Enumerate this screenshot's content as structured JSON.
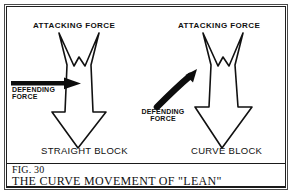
{
  "figure": {
    "number_label": "FIG. 30",
    "caption": "THE CURVE MOVEMENT OF \"LEAN\"",
    "panels": [
      {
        "id": "straight-block",
        "title": "STRAIGHT BLOCK",
        "attacking_force_label": "ATTACKING FORCE",
        "defending_force_label": "DEFENDING\nFORCE",
        "defending_force_line1": "DEFENDING",
        "defending_force_line2": "FORCE",
        "defending_arrow_type": "straight-right-arrow",
        "attacking_arrow_type": "double-headed-down-arrow"
      },
      {
        "id": "curve-block",
        "title": "CURVE BLOCK",
        "attacking_force_label": "ATTACKING FORCE",
        "defending_force_label": "DEFENDING\nFORCE",
        "defending_force_line1": "DEFENDING",
        "defending_force_line2": "FORCE",
        "defending_arrow_type": "curved-up-right-arrow",
        "attacking_arrow_type": "double-headed-down-arrow"
      }
    ]
  },
  "colors": {
    "ink": "#111111",
    "frame_outer": "#4a4a4a",
    "frame_inner": "#202020",
    "paper": "#ffffff"
  }
}
